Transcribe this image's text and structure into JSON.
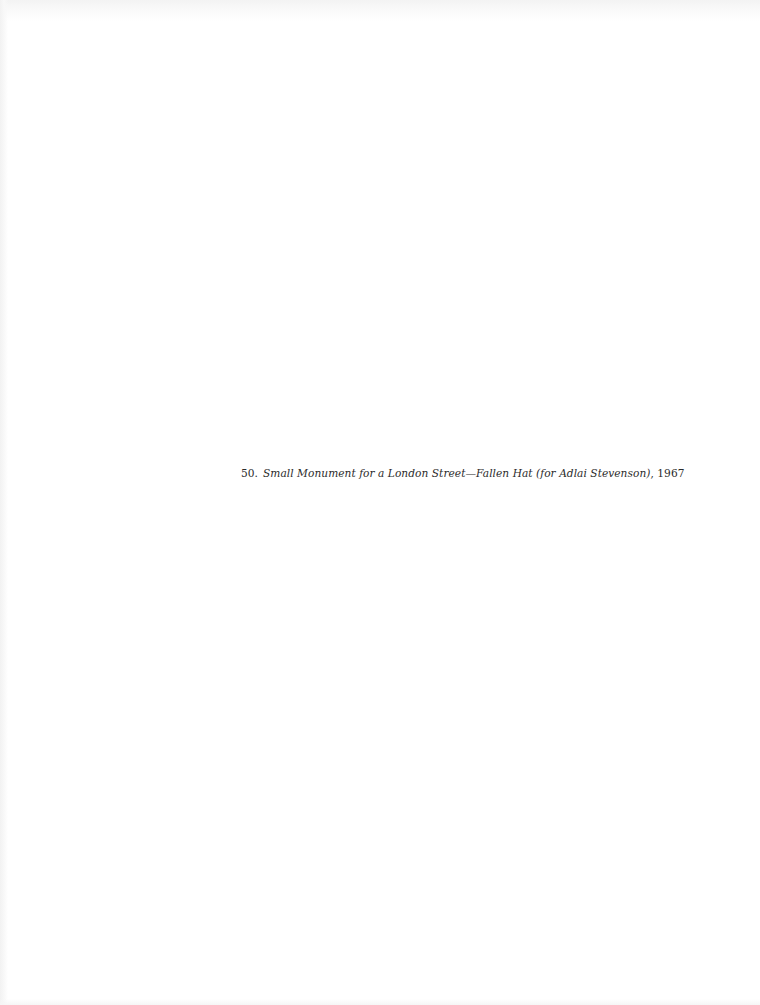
{
  "figure": {
    "number": "50.",
    "title": "Small Monument for a London Street—Fallen Hat (for Adlai Stevenson)",
    "year_suffix": ", 1967"
  },
  "colors": {
    "page_background": "#ffffff",
    "text": "#2b2b2b",
    "scan_edge": "#f3f3f3"
  }
}
